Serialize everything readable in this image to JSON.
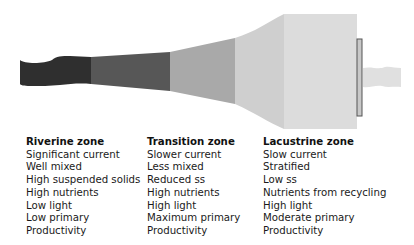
{
  "diagram": {
    "colors": {
      "riverine": "#2f2f2f",
      "transition_upper": "#575757",
      "transition_lower": "#a9a9a9",
      "lacustrine_neck": "#cfcfcf",
      "lacustrine_box": "#dcdcdc",
      "dam": "#c8c8c8",
      "dam_border": "#555555",
      "outflow": "#e0e0e0"
    }
  },
  "zones": [
    {
      "title": "Riverine zone",
      "lines": [
        "Significant current",
        "Well mixed",
        "High suspended solids",
        "High nutrients",
        "Low light",
        "Low primary",
        "Productivity"
      ]
    },
    {
      "title": "Transition zone",
      "lines": [
        "Slower current",
        "Less mixed",
        "Reduced ss",
        "High nutrients",
        "High light",
        "Maximum primary",
        "Productivity"
      ]
    },
    {
      "title": "Lacustrine zone",
      "lines": [
        "Slow current",
        "Stratified",
        "Low ss",
        "Nutrients from recycling",
        "High light",
        "Moderate primary",
        "Productivity"
      ]
    }
  ]
}
